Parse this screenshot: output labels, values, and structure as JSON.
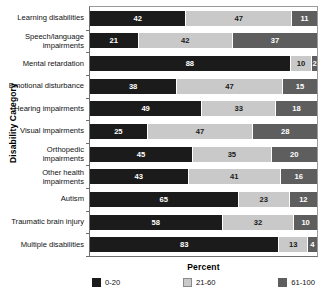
{
  "chart_data": {
    "type": "bar",
    "orientation": "horizontal",
    "stacked": true,
    "stack_total": 100,
    "title": "",
    "xlabel": "Percent",
    "ylabel": "Disability Category",
    "xlim": [
      0,
      100
    ],
    "grid": false,
    "legend_position": "bottom",
    "categories": [
      "Learning disabilities",
      "Speech/language impairments",
      "Mental retardation",
      "Emotional disturbance",
      "Hearing impairments",
      "Visual impairments",
      "Orthopedic impairments",
      "Other health impairments",
      "Autism",
      "Traumatic brain injury",
      "Multiple disabilities"
    ],
    "series": [
      {
        "name": "0-20",
        "color": "#1b1b1b",
        "values": [
          42,
          21,
          88,
          38,
          49,
          25,
          45,
          43,
          65,
          58,
          83
        ]
      },
      {
        "name": "21-60",
        "color": "#c9c9c9",
        "values": [
          47,
          42,
          10,
          47,
          33,
          47,
          35,
          41,
          23,
          32,
          13
        ]
      },
      {
        "name": "61-100",
        "color": "#5e5e5e",
        "values": [
          11,
          37,
          2,
          15,
          18,
          28,
          20,
          16,
          12,
          10,
          4
        ]
      }
    ],
    "legend": [
      "0-20",
      "21-60",
      "61-100"
    ]
  }
}
